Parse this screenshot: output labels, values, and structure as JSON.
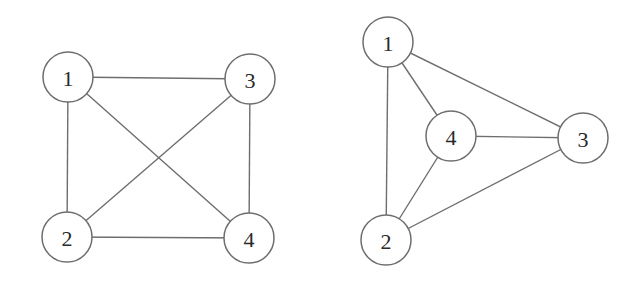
{
  "diagram": {
    "type": "graph",
    "colors": {
      "stroke": "#6e6e6e",
      "label": "#2a2a2a",
      "fill": "#ffffff"
    },
    "node_radius": 25,
    "graphs": [
      {
        "name": "left-graph",
        "layout": "square with crossing diagonals",
        "nodes": [
          {
            "id": "1",
            "label": "1",
            "x": 68,
            "y": 77
          },
          {
            "id": "2",
            "label": "2",
            "x": 67,
            "y": 237
          },
          {
            "id": "3",
            "label": "3",
            "x": 250,
            "y": 79
          },
          {
            "id": "4",
            "label": "4",
            "x": 249,
            "y": 238
          }
        ],
        "edges": [
          {
            "from": "1",
            "to": "3"
          },
          {
            "from": "1",
            "to": "2"
          },
          {
            "from": "1",
            "to": "4"
          },
          {
            "from": "2",
            "to": "3"
          },
          {
            "from": "2",
            "to": "4"
          },
          {
            "from": "3",
            "to": "4"
          }
        ]
      },
      {
        "name": "right-graph",
        "layout": "planar triangle with center vertex",
        "nodes": [
          {
            "id": "1",
            "label": "1",
            "x": 388,
            "y": 42
          },
          {
            "id": "2",
            "label": "2",
            "x": 386,
            "y": 240
          },
          {
            "id": "3",
            "label": "3",
            "x": 583,
            "y": 138
          },
          {
            "id": "4",
            "label": "4",
            "x": 451,
            "y": 136
          }
        ],
        "edges": [
          {
            "from": "1",
            "to": "2"
          },
          {
            "from": "1",
            "to": "3"
          },
          {
            "from": "1",
            "to": "4"
          },
          {
            "from": "4",
            "to": "3"
          },
          {
            "from": "4",
            "to": "2"
          },
          {
            "from": "2",
            "to": "3"
          }
        ]
      }
    ]
  }
}
